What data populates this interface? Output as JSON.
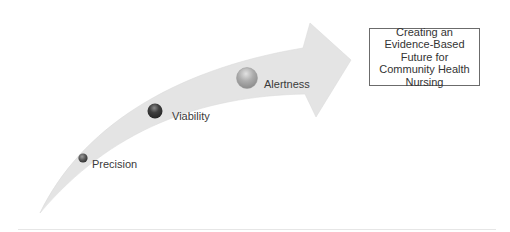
{
  "diagram": {
    "type": "curved-arrow-progression",
    "arrow_color": "#e4e4e4",
    "milestones": [
      {
        "label": "Precision",
        "dot_color": "#555555",
        "size": "small"
      },
      {
        "label": "Viability",
        "dot_color": "#3f3f3f",
        "size": "medium"
      },
      {
        "label": "Alertness",
        "dot_color": "#a8a8a8",
        "size": "large"
      }
    ],
    "goal": {
      "text": "Creating an Evidence-Based Future for Community Health Nursing"
    }
  }
}
